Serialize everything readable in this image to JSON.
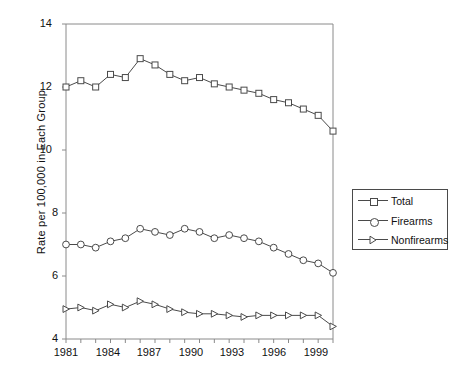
{
  "chart_data": {
    "type": "line",
    "title": "",
    "xlabel": "",
    "ylabel": "Rate per 100,000 in Each Group",
    "xlim": [
      1981,
      1999
    ],
    "ylim": [
      4,
      14
    ],
    "yticks": [
      4,
      6,
      8,
      10,
      12,
      14
    ],
    "xticks": [
      1981,
      1984,
      1987,
      1990,
      1993,
      1996,
      1999
    ],
    "xtick_labels": [
      "1981",
      "1984",
      "1987",
      "1990",
      "1993",
      "1996",
      "1999"
    ],
    "ytick_labels": [
      "4",
      "6",
      "8",
      "10",
      "12",
      "14"
    ],
    "x": [
      1981,
      1982,
      1983,
      1984,
      1985,
      1986,
      1987,
      1988,
      1989,
      1990,
      1991,
      1992,
      1993,
      1994,
      1995,
      1996,
      1997,
      1998,
      1999
    ],
    "grid": false,
    "legend_position": "right-middle",
    "series": [
      {
        "name": "Total",
        "marker": "square",
        "values": [
          12.0,
          12.2,
          12.0,
          12.4,
          12.3,
          12.9,
          12.7,
          12.4,
          12.2,
          12.3,
          12.1,
          12.0,
          11.9,
          11.8,
          11.6,
          11.5,
          11.3,
          11.1,
          10.6
        ]
      },
      {
        "name": "Firearms",
        "marker": "circle",
        "values": [
          7.0,
          7.0,
          6.9,
          7.1,
          7.2,
          7.5,
          7.4,
          7.3,
          7.5,
          7.4,
          7.2,
          7.3,
          7.2,
          7.1,
          6.9,
          6.7,
          6.5,
          6.4,
          6.1
        ]
      },
      {
        "name": "Nonfirearms",
        "marker": "triangle",
        "values": [
          4.95,
          5.0,
          4.9,
          5.1,
          5.0,
          5.2,
          5.1,
          4.95,
          4.85,
          4.8,
          4.8,
          4.75,
          4.7,
          4.75,
          4.75,
          4.75,
          4.75,
          4.75,
          4.4
        ]
      }
    ],
    "colors": {
      "line": "#4a4a4a",
      "axis": "#8a8a8a",
      "marker_fill": "#ffffff",
      "text": "#111111",
      "background": "#ffffff"
    }
  },
  "legend": {
    "items": [
      {
        "label": "Total",
        "marker": "square"
      },
      {
        "label": "Firearms",
        "marker": "circle"
      },
      {
        "label": "Nonfirearms",
        "marker": "triangle"
      }
    ]
  }
}
